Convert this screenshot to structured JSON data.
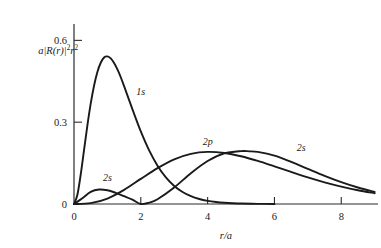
{
  "figure": {
    "background_color": "#ffffff",
    "ink_color": "#1a1a1a"
  },
  "axes": {
    "y_axis_label": "a|R(r)|²r²",
    "y_axis_label_parts": {
      "lead": "a|R(",
      "var": "r",
      "mid": ")|",
      "exp1": "2",
      "var2": "r",
      "exp2": "2"
    },
    "x_axis_label": "r/a",
    "x_ticks": [
      "0",
      "2",
      "4",
      "6",
      "8"
    ],
    "x_tick_values": [
      0,
      2,
      4,
      6,
      8
    ],
    "y_ticks": [
      "0",
      "0.3",
      "0.6"
    ],
    "y_tick_values": [
      0,
      0.3,
      0.6
    ]
  },
  "annotations": {
    "label_1s": "1s",
    "label_2s_left": "2s",
    "label_2p": "2p",
    "label_2s_right": "2s"
  },
  "chart_data": {
    "type": "line",
    "title": "",
    "subtitle": "",
    "xlabel": "r/a",
    "ylabel": "a|R(r)|²r²",
    "xlim": [
      0,
      9.1
    ],
    "ylim": [
      0,
      0.66
    ],
    "grid": false,
    "legend": "inline-curve-labels",
    "xticks": [
      0,
      2,
      4,
      6,
      8
    ],
    "yticks": [
      0,
      0.3,
      0.6
    ],
    "annotations": [
      {
        "text": "1s",
        "x": 2.0,
        "y": 0.4
      },
      {
        "text": "2s",
        "x": 1.0,
        "y": 0.085
      },
      {
        "text": "2p",
        "x": 4.0,
        "y": 0.215
      },
      {
        "text": "2s",
        "x": 6.8,
        "y": 0.195
      }
    ],
    "series": [
      {
        "name": "1s",
        "peak_x": 1.0,
        "peak_y": 0.53,
        "x": [
          0,
          0.1,
          0.2,
          0.3,
          0.4,
          0.5,
          0.6,
          0.7,
          0.8,
          0.9,
          1.0,
          1.1,
          1.2,
          1.3,
          1.4,
          1.5,
          1.75,
          2.0,
          2.25,
          2.5,
          2.75,
          3.0,
          3.25,
          3.5,
          3.75,
          4.0,
          4.25,
          4.5,
          4.75,
          5.0,
          5.5,
          6.0
        ],
        "values": [
          0.0,
          0.0328,
          0.1072,
          0.1975,
          0.2877,
          0.3679,
          0.4337,
          0.484,
          0.518,
          0.5372,
          0.5413,
          0.5338,
          0.5171,
          0.4935,
          0.4648,
          0.432,
          0.3472,
          0.2661,
          0.1965,
          0.1404,
          0.0975,
          0.0661,
          0.044,
          0.0287,
          0.0184,
          0.0116,
          0.0072,
          0.0044,
          0.0027,
          0.0016,
          0.0006,
          0.0002
        ]
      },
      {
        "name": "2s",
        "node_x": 2.0,
        "first_peak_x": 0.77,
        "first_peak_y": 0.053,
        "second_peak_x": 5.25,
        "second_peak_y": 0.191,
        "x": [
          0,
          0.25,
          0.5,
          0.75,
          1.0,
          1.25,
          1.5,
          1.75,
          2.0,
          2.25,
          2.5,
          3.0,
          3.5,
          4.0,
          4.5,
          5.0,
          5.25,
          5.5,
          6.0,
          6.5,
          7.0,
          7.5,
          8.0,
          8.5,
          9.0
        ],
        "values": [
          0.0,
          0.0211,
          0.0445,
          0.053,
          0.0503,
          0.0409,
          0.0288,
          0.0158,
          0.0,
          0.0048,
          0.0176,
          0.0607,
          0.1131,
          0.1576,
          0.1856,
          0.194,
          0.193,
          0.191,
          0.1775,
          0.1546,
          0.1286,
          0.103,
          0.08,
          0.0604,
          0.0445
        ]
      },
      {
        "name": "2p",
        "peak_x": 4.0,
        "peak_y": 0.191,
        "x": [
          0,
          0.5,
          1.0,
          1.5,
          2.0,
          2.5,
          3.0,
          3.5,
          4.0,
          4.5,
          5.0,
          5.5,
          6.0,
          6.5,
          7.0,
          7.5,
          8.0,
          8.5,
          9.0
        ],
        "values": [
          0.0,
          0.003,
          0.02,
          0.052,
          0.092,
          0.1315,
          0.164,
          0.184,
          0.191,
          0.187,
          0.175,
          0.158,
          0.138,
          0.1175,
          0.0975,
          0.0795,
          0.064,
          0.0505,
          0.0395
        ]
      }
    ]
  }
}
